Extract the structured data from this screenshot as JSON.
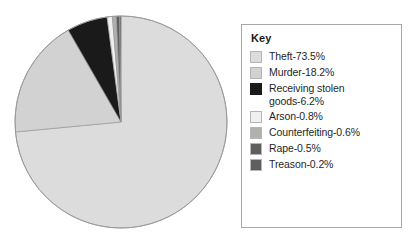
{
  "chart_data": {
    "type": "pie",
    "title": "",
    "legend_title": "Key",
    "legend_position": "right",
    "start_angle_deg": 0,
    "direction": "clockwise",
    "units": "percent",
    "categories": [
      "Theft",
      "Murder",
      "Receiving stolen goods",
      "Arson",
      "Counterfeiting",
      "Rape",
      "Treason"
    ],
    "values": [
      73.5,
      18.2,
      6.2,
      0.8,
      0.6,
      0.5,
      0.2
    ],
    "colors": [
      "#dcdcdc",
      "#d2d2d2",
      "#1a1a1a",
      "#f0f0f0",
      "#b0b0b0",
      "#5e5e5e",
      "#5e5e5e"
    ],
    "slices": [
      {
        "label": "Theft-73.5%",
        "name": "Theft",
        "value": 73.5,
        "color": "#dcdcdc",
        "swatch": "#dcdcdc"
      },
      {
        "label": "Murder-18.2%",
        "name": "Murder",
        "value": 18.2,
        "color": "#d2d2d2",
        "swatch": "#d2d2d2"
      },
      {
        "label": "Receiving stolen\ngoods-6.2%",
        "name": "Receiving stolen goods",
        "value": 6.2,
        "color": "#1a1a1a",
        "swatch": "#1a1a1a"
      },
      {
        "label": "Arson-0.8%",
        "name": "Arson",
        "value": 0.8,
        "color": "#f0f0f0",
        "swatch": "#f0f0f0"
      },
      {
        "label": "Counterfeiting-0.6%",
        "name": "Counterfeiting",
        "value": 0.6,
        "color": "#b0b0b0",
        "swatch": "#b0b0b0"
      },
      {
        "label": "Rape-0.5%",
        "name": "Rape",
        "value": 0.5,
        "color": "#5e5e5e",
        "swatch": "#5e5e5e"
      },
      {
        "label": "Treason-0.2%",
        "name": "Treason",
        "value": 0.2,
        "color": "#5e5e5e",
        "swatch": "#5e5e5e"
      }
    ],
    "geometry": {
      "center_x": 108,
      "center_y": 108,
      "radius": 106,
      "outline_color": "#9a9a9a"
    }
  }
}
